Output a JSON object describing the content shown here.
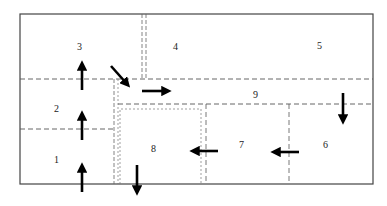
{
  "diagram": {
    "type": "floor-plan-flow",
    "zones": [
      {
        "id": "1",
        "label": "1"
      },
      {
        "id": "2",
        "label": "2"
      },
      {
        "id": "3",
        "label": "3"
      },
      {
        "id": "4",
        "label": "4"
      },
      {
        "id": "5",
        "label": "5"
      },
      {
        "id": "6",
        "label": "6"
      },
      {
        "id": "7",
        "label": "7"
      },
      {
        "id": "8",
        "label": "8"
      },
      {
        "id": "9",
        "label": "9"
      }
    ],
    "arrows": [
      {
        "from": "outside",
        "to": "1",
        "direction": "up"
      },
      {
        "from": "1",
        "to": "2",
        "direction": "up"
      },
      {
        "from": "2",
        "to": "3",
        "direction": "up"
      },
      {
        "from": "3",
        "to": "9",
        "direction": "down-right"
      },
      {
        "from": "9",
        "to": "9",
        "direction": "right"
      },
      {
        "from": "9",
        "to": "6",
        "direction": "down"
      },
      {
        "from": "6",
        "to": "7",
        "direction": "left"
      },
      {
        "from": "7",
        "to": "8",
        "direction": "left"
      },
      {
        "from": "8",
        "to": "outside",
        "direction": "down"
      }
    ],
    "colors": {
      "line": "#444444",
      "arrow": "#000000",
      "text": "#222222"
    }
  }
}
